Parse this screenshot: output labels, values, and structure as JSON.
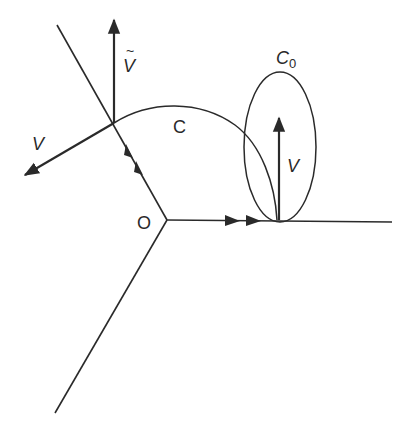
{
  "diagram": {
    "colors": {
      "ink": "#2a2a2a",
      "background": "#ffffff"
    },
    "labels": {
      "origin": "O",
      "curve": "C",
      "ellipse": "C",
      "ellipse_sub": "0",
      "vec_left": "V",
      "vec_tilde": "V",
      "tilde_mark": "~",
      "vec_right": "V"
    },
    "elements": [
      "ray-upper-left",
      "ray-right",
      "ray-lower-left",
      "curve-C",
      "ellipse-C0",
      "vector-V-tilde",
      "vector-V-left",
      "vector-V-right",
      "flow-arrows-upper-ray",
      "flow-arrows-right-ray"
    ]
  }
}
